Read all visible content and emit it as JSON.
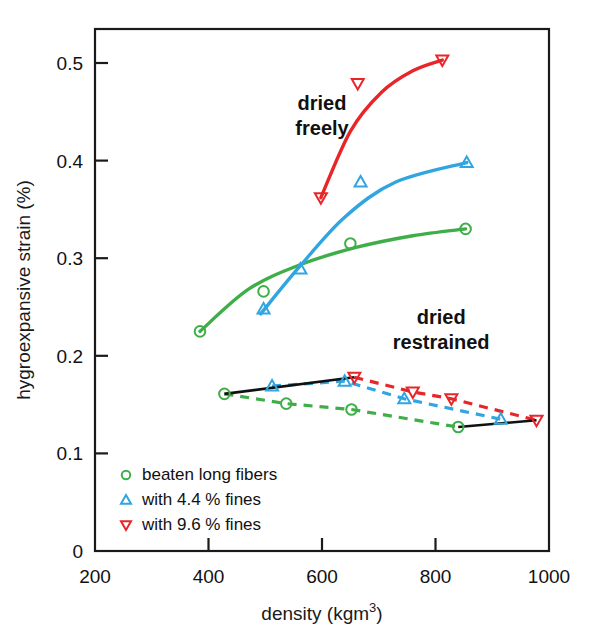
{
  "chart_data": {
    "type": "scatter",
    "title": "",
    "xlabel": "density (kgm3)",
    "xlabel_base": "density (kgm",
    "xlabel_sup": "3",
    "xlabel_tail": ")",
    "ylabel": "hygroexpansive strain (%)",
    "xlim": [
      200,
      1000
    ],
    "ylim": [
      0,
      0.55
    ],
    "xticks": [
      200,
      400,
      600,
      800,
      1000
    ],
    "xtick_labels": [
      "200",
      "400",
      "600",
      "800",
      "1000"
    ],
    "yticks": [
      0,
      0.1,
      0.2,
      0.3,
      0.4,
      0.5
    ],
    "ytick_labels": [
      "0",
      "0.1",
      "0.2",
      "0.3",
      "0.4",
      "0.5"
    ],
    "grid": false,
    "legend_position": "lower-left-inside",
    "annotations": [
      {
        "name": "dried-freely",
        "text_line1": "dried",
        "text_line2": "freely",
        "x": 600,
        "y": 0.452
      },
      {
        "name": "dried-restrained",
        "text_line1": "dried",
        "text_line2": "restrained",
        "x": 810,
        "y": 0.233
      }
    ],
    "colors": {
      "beaten_long_fibers": "#3fae49",
      "fines_4_4": "#30a5e0",
      "fines_9_6": "#e8262a",
      "connector": "#111111",
      "axis": "#1a1a1a"
    },
    "series": [
      {
        "name": "beaten long fibers",
        "legend_label": "beaten long fibers",
        "marker": "circle",
        "color": "#3fae49",
        "dried_freely": {
          "points": [
            {
              "x": 385,
              "y": 0.225
            },
            {
              "x": 497,
              "y": 0.266
            },
            {
              "x": 650,
              "y": 0.315
            },
            {
              "x": 853,
              "y": 0.33
            }
          ],
          "fit_curve": [
            {
              "x": 385,
              "y": 0.225
            },
            {
              "x": 470,
              "y": 0.268
            },
            {
              "x": 560,
              "y": 0.293
            },
            {
              "x": 660,
              "y": 0.311
            },
            {
              "x": 760,
              "y": 0.323
            },
            {
              "x": 853,
              "y": 0.33
            }
          ]
        },
        "dried_restrained": {
          "points": [
            {
              "x": 428,
              "y": 0.161
            },
            {
              "x": 537,
              "y": 0.151
            },
            {
              "x": 652,
              "y": 0.145
            },
            {
              "x": 840,
              "y": 0.127
            }
          ]
        }
      },
      {
        "name": "with 4.4 % fines",
        "legend_label": "with 4.4 % fines",
        "marker": "triangle-up",
        "color": "#30a5e0",
        "dried_freely": {
          "points": [
            {
              "x": 497,
              "y": 0.248
            },
            {
              "x": 562,
              "y": 0.289
            },
            {
              "x": 668,
              "y": 0.378
            },
            {
              "x": 855,
              "y": 0.398
            }
          ],
          "fit_curve": [
            {
              "x": 492,
              "y": 0.243
            },
            {
              "x": 560,
              "y": 0.291
            },
            {
              "x": 640,
              "y": 0.342
            },
            {
              "x": 730,
              "y": 0.378
            },
            {
              "x": 855,
              "y": 0.398
            }
          ]
        },
        "dried_restrained": {
          "points": [
            {
              "x": 512,
              "y": 0.169
            },
            {
              "x": 640,
              "y": 0.174
            },
            {
              "x": 745,
              "y": 0.156
            },
            {
              "x": 915,
              "y": 0.135
            }
          ]
        }
      },
      {
        "name": "with 9.6 % fines",
        "legend_label": "with 9.6 % fines",
        "marker": "triangle-down",
        "color": "#e8262a",
        "dried_freely": {
          "points": [
            {
              "x": 598,
              "y": 0.362
            },
            {
              "x": 663,
              "y": 0.479
            },
            {
              "x": 812,
              "y": 0.503
            }
          ],
          "fit_curve": [
            {
              "x": 598,
              "y": 0.362
            },
            {
              "x": 650,
              "y": 0.43
            },
            {
              "x": 705,
              "y": 0.47
            },
            {
              "x": 760,
              "y": 0.492
            },
            {
              "x": 812,
              "y": 0.503
            }
          ]
        },
        "dried_restrained": {
          "points": [
            {
              "x": 657,
              "y": 0.178
            },
            {
              "x": 760,
              "y": 0.163
            },
            {
              "x": 828,
              "y": 0.156
            },
            {
              "x": 978,
              "y": 0.134
            }
          ]
        }
      }
    ],
    "connectors": [
      {
        "name": "left-envelope",
        "from": {
          "x": 428,
          "y": 0.161
        },
        "to": {
          "x": 657,
          "y": 0.178
        },
        "style": "solid",
        "color": "#111111"
      },
      {
        "name": "right-envelope",
        "from": {
          "x": 840,
          "y": 0.127
        },
        "to": {
          "x": 978,
          "y": 0.134
        },
        "style": "solid",
        "color": "#111111"
      }
    ]
  },
  "legend": {
    "items": [
      {
        "label": "beaten long fibers",
        "marker": "circle",
        "color": "#3fae49"
      },
      {
        "label": "with 4.4 % fines",
        "marker": "triangle-up",
        "color": "#30a5e0"
      },
      {
        "label": "with 9.6 % fines",
        "marker": "triangle-down",
        "color": "#e8262a"
      }
    ]
  }
}
